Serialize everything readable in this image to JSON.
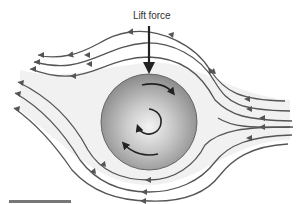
{
  "diagram": {
    "labels": {
      "force": "Lift force"
    },
    "colors": {
      "streamline": "#555555",
      "arrow": "#222222",
      "cylinder_center": "#f2f2f2",
      "cylinder_edge": "#8a8a8a",
      "wake_fill": "#eeeeee",
      "scale_bar": "#777777"
    },
    "flow_direction": "right-to-left",
    "rotation_direction": "clockwise",
    "scale_bar": {
      "visible": true
    }
  }
}
